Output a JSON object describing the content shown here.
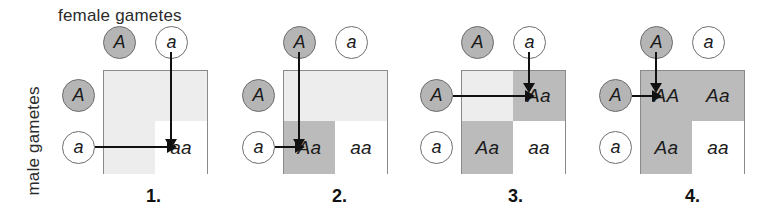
{
  "axes": {
    "female_label": "female gametes",
    "male_label": "male gametes"
  },
  "alleles": {
    "dominant": "A",
    "recessive": "a"
  },
  "colors": {
    "shade_light": "#ededed",
    "shade_dark": "#bbbbbb",
    "shade_white": "#ffffff",
    "circle_filled": "#b5b5b5",
    "grid_line": "#8a8a8a",
    "arrow": "#111111"
  },
  "panels": [
    {
      "caption": "1.",
      "top_circles": [
        {
          "label": "A",
          "filled": true
        },
        {
          "label": "a",
          "filled": false
        }
      ],
      "left_circles": [
        {
          "label": "A",
          "filled": true
        },
        {
          "label": "a",
          "filled": false
        }
      ],
      "cells": {
        "tl": {
          "text": "",
          "shade": "light"
        },
        "tr": {
          "text": "",
          "shade": "light"
        },
        "bl": {
          "text": "",
          "shade": "light"
        },
        "br": {
          "text": "aa",
          "shade": "white"
        }
      },
      "arrows": {
        "vertical": "right-column",
        "horizontal": "bottom-row"
      }
    },
    {
      "caption": "2.",
      "top_circles": [
        {
          "label": "A",
          "filled": true
        },
        {
          "label": "a",
          "filled": false
        }
      ],
      "left_circles": [
        {
          "label": "A",
          "filled": true
        },
        {
          "label": "a",
          "filled": false
        }
      ],
      "cells": {
        "tl": {
          "text": "",
          "shade": "light"
        },
        "tr": {
          "text": "",
          "shade": "light"
        },
        "bl": {
          "text": "Aa",
          "shade": "dark"
        },
        "br": {
          "text": "aa",
          "shade": "white"
        }
      },
      "arrows": {
        "vertical": "left-column",
        "horizontal": "bottom-row"
      }
    },
    {
      "caption": "3.",
      "top_circles": [
        {
          "label": "A",
          "filled": true
        },
        {
          "label": "a",
          "filled": false
        }
      ],
      "left_circles": [
        {
          "label": "A",
          "filled": true
        },
        {
          "label": "a",
          "filled": false
        }
      ],
      "cells": {
        "tl": {
          "text": "",
          "shade": "light"
        },
        "tr": {
          "text": "Aa",
          "shade": "dark"
        },
        "bl": {
          "text": "Aa",
          "shade": "dark"
        },
        "br": {
          "text": "aa",
          "shade": "white"
        }
      },
      "arrows": {
        "vertical": "right-column",
        "horizontal": "top-row"
      }
    },
    {
      "caption": "4.",
      "top_circles": [
        {
          "label": "A",
          "filled": true
        },
        {
          "label": "a",
          "filled": false
        }
      ],
      "left_circles": [
        {
          "label": "A",
          "filled": true
        },
        {
          "label": "a",
          "filled": false
        }
      ],
      "cells": {
        "tl": {
          "text": "AA",
          "shade": "dark"
        },
        "tr": {
          "text": "Aa",
          "shade": "dark"
        },
        "bl": {
          "text": "Aa",
          "shade": "dark"
        },
        "br": {
          "text": "aa",
          "shade": "white"
        }
      },
      "arrows": {
        "vertical": "left-column",
        "horizontal": "top-row"
      }
    }
  ]
}
